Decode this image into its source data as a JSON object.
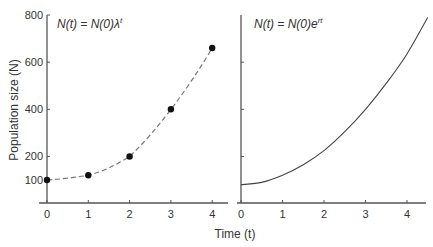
{
  "chart_data": [
    {
      "type": "line",
      "panel": "left",
      "title": "N(t) = N(0)λ^t",
      "title_parts": {
        "main": "N(t) = N(0)λ",
        "sup": "t"
      },
      "xlabel": "Time (t)",
      "ylabel": "Population size (N)",
      "x": [
        0,
        1,
        2,
        3,
        4
      ],
      "values": [
        100,
        120,
        200,
        400,
        660
      ],
      "style": "dashed line with filled circle markers",
      "xlim": [
        0,
        4.5
      ],
      "ylim": [
        0,
        800
      ],
      "xticks": [
        "0",
        "1",
        "2",
        "3",
        "4"
      ],
      "yticks": [
        "100",
        "200",
        "400",
        "600",
        "800"
      ],
      "grid": false
    },
    {
      "type": "line",
      "panel": "right",
      "title": "N(t) = N(0)e^rt",
      "title_parts": {
        "main": "N(t) = N(0)e",
        "sup": "rt"
      },
      "xlabel": "Time (t)",
      "x": [
        0,
        0.5,
        1,
        1.5,
        2,
        2.5,
        3,
        3.5,
        4,
        4.5
      ],
      "values": [
        80,
        90,
        120,
        165,
        225,
        305,
        400,
        510,
        635,
        790
      ],
      "style": "solid smooth curve",
      "xlim": [
        0,
        4.5
      ],
      "ylim": [
        0,
        800
      ],
      "xticks": [
        "0",
        "1",
        "2",
        "3",
        "4"
      ],
      "yticks": [],
      "grid": false
    }
  ],
  "labels": {
    "xlabel": "Time (t)",
    "ylabel": "Population size (N)"
  },
  "colors": {
    "axis": "#555555",
    "line": "#444444",
    "dashed": "#777777",
    "marker": "#111111"
  }
}
